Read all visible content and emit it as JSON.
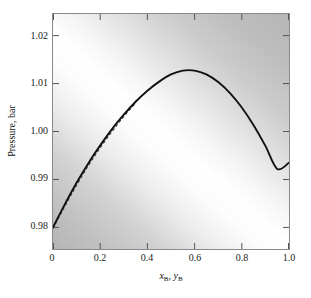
{
  "chart_data": {
    "type": "line",
    "title": "",
    "xlabel": "x_B, y_B",
    "ylabel": "Pressure, bar",
    "xlim": [
      0,
      1
    ],
    "ylim": [
      0.9755,
      1.0245
    ],
    "grid": false,
    "legend": "none",
    "xticks": [
      "0",
      "0.2",
      "0.4",
      "0.6",
      "0.8",
      "1.0"
    ],
    "xtick_values": [
      0,
      0.2,
      0.4,
      0.6,
      0.8,
      1.0
    ],
    "yticks": [
      "0.98",
      "0.99",
      "1.00",
      "1.01",
      "1.02"
    ],
    "ytick_values": [
      0.98,
      0.99,
      1.0,
      1.01,
      1.02
    ],
    "series": [
      {
        "name": "solid-curve",
        "style": "solid",
        "color": "#111111",
        "x": [
          0.0,
          0.05,
          0.1,
          0.15,
          0.2,
          0.25,
          0.3,
          0.35,
          0.4,
          0.45,
          0.5,
          0.55,
          0.6,
          0.65,
          0.7,
          0.75,
          0.8,
          0.85,
          0.9,
          0.95,
          1.0
        ],
        "values": [
          0.98,
          0.9848,
          0.9893,
          0.9934,
          0.9971,
          1.0005,
          1.0035,
          1.0062,
          1.0085,
          1.0104,
          1.0119,
          1.0127,
          1.0127,
          1.0119,
          1.0103,
          1.008,
          1.005,
          1.0013,
          0.997,
          0.9922,
          0.9935
        ]
      },
      {
        "name": "dashed-curve",
        "style": "dashed",
        "color": "#3c3c3c",
        "x": [
          0.0,
          0.05,
          0.1,
          0.15,
          0.2,
          0.25,
          0.3,
          0.35
        ],
        "values": [
          0.9798,
          0.9844,
          0.9888,
          0.9929,
          0.9966,
          1.0,
          1.0031,
          1.0059
        ]
      }
    ],
    "annotations": [],
    "background": {
      "type": "diagonal-gradient",
      "dark": "#b4b4b4",
      "bright": "#ffffff"
    }
  },
  "axes": {
    "ylabel_text": "Pressure, bar",
    "xlabel_parts": {
      "x_symbol": "x",
      "x_subscript": "B",
      "separator": ",",
      "y_symbol": "y",
      "y_subscript": "B"
    }
  }
}
